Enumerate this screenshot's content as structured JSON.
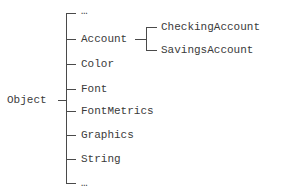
{
  "diagram": {
    "type": "class-hierarchy-tree",
    "root": {
      "label": "Object"
    },
    "children": [
      {
        "label": "…"
      },
      {
        "label": "Account",
        "children": [
          {
            "label": "CheckingAccount"
          },
          {
            "label": "SavingsAccount"
          }
        ]
      },
      {
        "label": "Color"
      },
      {
        "label": "Font"
      },
      {
        "label": "FontMetrics"
      },
      {
        "label": "Graphics"
      },
      {
        "label": "String"
      },
      {
        "label": "…"
      }
    ],
    "line_color": "#4a4a4a",
    "text_color": "#3a3a3a"
  }
}
